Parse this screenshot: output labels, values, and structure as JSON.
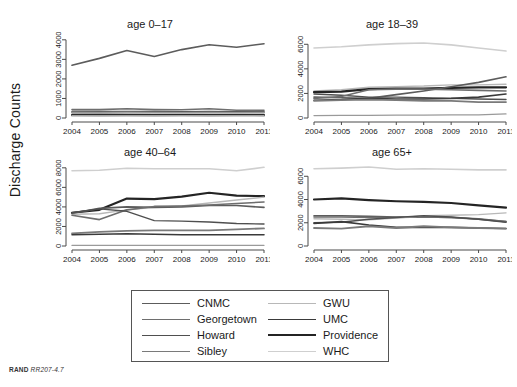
{
  "figure": {
    "ylabel": "Discharge Counts",
    "footer_brand": "RAND",
    "footer_id": "RR207-4.7"
  },
  "legend": {
    "columns": [
      {
        "items": [
          {
            "label": "CNMC",
            "color": "#5c5c5c",
            "width": 1.6
          },
          {
            "label": "Georgetown",
            "color": "#6e6e6e",
            "width": 1.6
          },
          {
            "label": "Howard",
            "color": "#4f4f4f",
            "width": 1.4
          },
          {
            "label": "Sibley",
            "color": "#7a7a7a",
            "width": 1.8
          }
        ]
      },
      {
        "items": [
          {
            "label": "GWU",
            "color": "#b8b8b8",
            "width": 1.4
          },
          {
            "label": "UMC",
            "color": "#3a3a3a",
            "width": 1.6
          },
          {
            "label": "Providence",
            "color": "#242424",
            "width": 2.2
          },
          {
            "label": "WHC",
            "color": "#cfcfcf",
            "width": 1.6
          }
        ]
      }
    ]
  },
  "chart_data": {
    "type": "line",
    "title": "",
    "xlabel": "",
    "ylabel": "Discharge Counts",
    "x": [
      2004,
      2005,
      2006,
      2007,
      2008,
      2009,
      2010,
      2011
    ],
    "xticklabels": [
      "2004",
      "2005",
      "2006",
      "2007",
      "2008",
      "2009",
      "2010",
      "2011"
    ],
    "grid": false,
    "legend_position": "bottom",
    "panels": [
      {
        "title": "age 0–17",
        "ylim": [
          0,
          4400
        ],
        "yticks": [
          0,
          1000,
          2000,
          3000,
          4000
        ],
        "yticklabels": [
          "0",
          "1000",
          "2000",
          "3000",
          "4000"
        ],
        "series": [
          {
            "name": "CNMC",
            "color": "#5c5c5c",
            "width": 1.6,
            "values": [
              2700,
              3050,
              3450,
              3150,
              3500,
              3750,
              3620,
              3800
            ]
          },
          {
            "name": "Georgetown",
            "color": "#6e6e6e",
            "width": 1.6,
            "values": [
              430,
              430,
              470,
              430,
              420,
              470,
              400,
              400
            ]
          },
          {
            "name": "Howard",
            "color": "#4f4f4f",
            "width": 1.4,
            "values": [
              330,
              330,
              340,
              330,
              320,
              330,
              320,
              330
            ]
          },
          {
            "name": "Sibley",
            "color": "#7a7a7a",
            "width": 1.8,
            "values": [
              300,
              290,
              300,
              290,
              280,
              290,
              280,
              290
            ]
          },
          {
            "name": "GWU",
            "color": "#b8b8b8",
            "width": 1.4,
            "values": [
              250,
              250,
              260,
              250,
              240,
              250,
              250,
              250
            ]
          },
          {
            "name": "UMC",
            "color": "#3a3a3a",
            "width": 1.6,
            "values": [
              180,
              175,
              180,
              170,
              165,
              170,
              165,
              170
            ]
          },
          {
            "name": "Providence",
            "color": "#242424",
            "width": 2.2,
            "values": [
              140,
              135,
              140,
              130,
              130,
              135,
              130,
              135
            ]
          },
          {
            "name": "WHC",
            "color": "#cfcfcf",
            "width": 1.6,
            "values": [
              100,
              100,
              105,
              100,
              95,
              100,
              95,
              100
            ]
          }
        ]
      },
      {
        "title": "age 18–39",
        "ylim": [
          0,
          7000
        ],
        "yticks": [
          0,
          2000,
          4000,
          6000
        ],
        "yticklabels": [
          "0",
          "2000",
          "4000",
          "6000"
        ],
        "series": [
          {
            "name": "WHC",
            "color": "#cfcfcf",
            "width": 1.6,
            "values": [
              5700,
              5800,
              5950,
              6050,
              6100,
              5950,
              5700,
              5450
            ]
          },
          {
            "name": "GWU",
            "color": "#b8b8b8",
            "width": 1.4,
            "values": [
              2200,
              2300,
              2500,
              2550,
              2600,
              2700,
              2700,
              2750
            ]
          },
          {
            "name": "Providence",
            "color": "#242424",
            "width": 2.2,
            "values": [
              2100,
              2150,
              2350,
              2400,
              2400,
              2450,
              2500,
              2500
            ]
          },
          {
            "name": "Howard",
            "color": "#4f4f4f",
            "width": 1.4,
            "values": [
              1950,
              1850,
              1700,
              1700,
              1650,
              1600,
              1550,
              1500
            ]
          },
          {
            "name": "CNMC",
            "color": "#5c5c5c",
            "width": 1.6,
            "values": [
              1700,
              1650,
              1600,
              1900,
              2200,
              2550,
              2900,
              3350
            ]
          },
          {
            "name": "Georgetown",
            "color": "#6e6e6e",
            "width": 1.6,
            "values": [
              1600,
              1750,
              2300,
              2350,
              2350,
              2300,
              2250,
              2200
            ]
          },
          {
            "name": "UMC",
            "color": "#3a3a3a",
            "width": 1.6,
            "values": [
              1450,
              1500,
              1600,
              1550,
              1550,
              1600,
              1700,
              1950
            ]
          },
          {
            "name": "Sibley",
            "color": "#7a7a7a",
            "width": 1.8,
            "values": [
              1400,
              1450,
              1500,
              1450,
              1400,
              1400,
              1300,
              1300
            ]
          },
          {
            "name": "GWU2",
            "color": "#9a9a9a",
            "width": 1.3,
            "values": [
              200,
              210,
              220,
              230,
              240,
              250,
              260,
              330
            ]
          }
        ]
      },
      {
        "title": "age 40–64",
        "ylim": [
          0,
          8800
        ],
        "yticks": [
          0,
          2000,
          4000,
          6000,
          8000
        ],
        "yticklabels": [
          "0",
          "2000",
          "4000",
          "6000",
          "8000"
        ],
        "series": [
          {
            "name": "WHC",
            "color": "#cfcfcf",
            "width": 1.6,
            "values": [
              7700,
              7750,
              7950,
              7900,
              7900,
              7900,
              7700,
              8050
            ]
          },
          {
            "name": "Providence",
            "color": "#242424",
            "width": 2.2,
            "values": [
              3400,
              3700,
              4850,
              4800,
              5050,
              5450,
              5150,
              5100
            ]
          },
          {
            "name": "GWU",
            "color": "#b8b8b8",
            "width": 1.4,
            "values": [
              3250,
              3300,
              3700,
              3950,
              4100,
              4400,
              4700,
              5000
            ]
          },
          {
            "name": "CNMC",
            "color": "#5c5c5c",
            "width": 1.6,
            "values": [
              3350,
              3850,
              4000,
              3950,
              4000,
              4150,
              4150,
              3950
            ]
          },
          {
            "name": "Georgetown",
            "color": "#6e6e6e",
            "width": 1.6,
            "values": [
              3150,
              2700,
              3700,
              4050,
              4100,
              4200,
              4350,
              4500
            ]
          },
          {
            "name": "Howard",
            "color": "#4f4f4f",
            "width": 1.4,
            "values": [
              3400,
              3800,
              3550,
              2600,
              2550,
              2450,
              2300,
              2250
            ]
          },
          {
            "name": "Sibley",
            "color": "#7a7a7a",
            "width": 1.8,
            "values": [
              1300,
              1450,
              1550,
              1600,
              1600,
              1600,
              1700,
              1800
            ]
          },
          {
            "name": "UMC",
            "color": "#3a3a3a",
            "width": 1.6,
            "values": [
              1150,
              1200,
              1250,
              1200,
              1150,
              1150,
              1150,
              1150
            ]
          },
          {
            "name": "GWU2",
            "color": "#9a9a9a",
            "width": 1.3,
            "values": [
              60,
              60,
              65,
              60,
              60,
              65,
              60,
              65
            ]
          }
        ]
      },
      {
        "title": "age 65+",
        "ylim": [
          0,
          7400
        ],
        "yticks": [
          0,
          2000,
          4000,
          6000
        ],
        "yticklabels": [
          "0",
          "2000",
          "4000",
          "6000"
        ],
        "series": [
          {
            "name": "WHC",
            "color": "#cfcfcf",
            "width": 1.6,
            "values": [
              6650,
              6700,
              6800,
              6600,
              6650,
              6600,
              6550,
              6550
            ]
          },
          {
            "name": "Providence",
            "color": "#242424",
            "width": 2.2,
            "values": [
              4000,
              4100,
              3950,
              3850,
              3800,
              3700,
              3500,
              3300
            ]
          },
          {
            "name": "CNMC",
            "color": "#5c5c5c",
            "width": 1.6,
            "values": [
              2600,
              2600,
              2550,
              2500,
              2500,
              2450,
              2300,
              2100
            ]
          },
          {
            "name": "Georgetown",
            "color": "#6e6e6e",
            "width": 1.6,
            "values": [
              2500,
              2500,
              2450,
              2450,
              2500,
              2450,
              2350,
              2100
            ]
          },
          {
            "name": "GWU",
            "color": "#b8b8b8",
            "width": 1.4,
            "values": [
              2350,
              2300,
              2250,
              2400,
              2600,
              2650,
              2700,
              2850
            ]
          },
          {
            "name": "Howard",
            "color": "#4f4f4f",
            "width": 1.4,
            "values": [
              2000,
              2050,
              2300,
              2450,
              2600,
              2500,
              2300,
              2050
            ]
          },
          {
            "name": "UMC",
            "color": "#3a3a3a",
            "width": 1.6,
            "values": [
              1950,
              2100,
              1800,
              1600,
              1600,
              1600,
              1550,
              1500
            ]
          },
          {
            "name": "Sibley",
            "color": "#7a7a7a",
            "width": 1.8,
            "values": [
              1550,
              1500,
              1700,
              1550,
              1700,
              1600,
              1550,
              1500
            ]
          }
        ]
      }
    ]
  }
}
